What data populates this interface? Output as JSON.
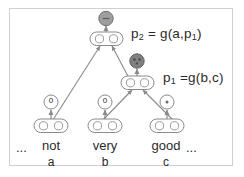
{
  "figure": {
    "type": "recursive-neural-network-composition-diagram",
    "width": 244,
    "height": 177,
    "background": "#ffffff",
    "frame_color": "#cfcfcf"
  },
  "colors": {
    "stroke": "#7a7a7a",
    "arrow": "#8a8a8a",
    "text": "#2b2b2b",
    "sentiment_node_light": "#9e9e9e",
    "sentiment_node_dark": "#808080",
    "node_fill": "#ffffff"
  },
  "formulas": {
    "p2": {
      "lhs": "p",
      "lhs_sub": "2",
      "rhs": " = g(a,p",
      "rhs_sub": "1",
      "rhs_tail": ")"
    },
    "p1": {
      "lhs": "p",
      "lhs_sub": "1",
      "rhs": " =g(b,c)",
      "rhs_sub": "",
      "rhs_tail": ""
    }
  },
  "formula_labels": {
    "p2_full": "p₂ = g(a,p₁)",
    "p1_full": "p₁ =g(b,c)"
  },
  "sentence": {
    "leading_ellipsis": "...",
    "trailing_ellipsis": "...",
    "words": [
      {
        "text": "not",
        "variable": "a",
        "classifier_value": "0"
      },
      {
        "text": "very",
        "variable": "b",
        "classifier_value": "0"
      },
      {
        "text": "good",
        "variable": "c",
        "classifier_value": "•"
      }
    ]
  },
  "phrase_nodes": [
    {
      "name": "p1",
      "classifier_value": "•",
      "fill": "#808080"
    },
    {
      "name": "p2",
      "classifier_value": "–",
      "fill": "#9e9e9e"
    }
  ]
}
